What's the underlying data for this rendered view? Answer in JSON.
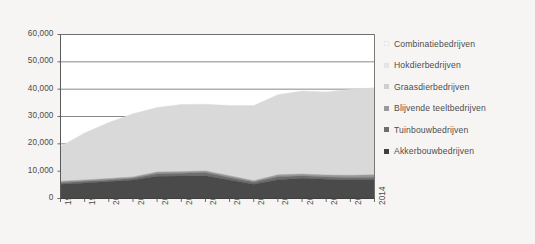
{
  "chart_data": {
    "type": "area",
    "title": "",
    "subtitle": "",
    "xlabel": "",
    "ylabel": "",
    "stacked": true,
    "grid": true,
    "legend_position": "right",
    "ylim": [
      0,
      60000
    ],
    "ytick_labels": [
      "0",
      "10,000",
      "20,000",
      "30,000",
      "40,000",
      "50,000",
      "60,000"
    ],
    "yticks": [
      0,
      10000,
      20000,
      30000,
      40000,
      50000,
      60000
    ],
    "categories": [
      "1998",
      "1999",
      "2000",
      "2001",
      "2002",
      "2003",
      "2004",
      "2007",
      "2009",
      "2010",
      "2011",
      "2012",
      "2013",
      "2014"
    ],
    "x": [
      "1998",
      "1999",
      "2000",
      "2001",
      "2002",
      "2003",
      "2004",
      "2007",
      "2009",
      "2010",
      "2011",
      "2012",
      "2013",
      "2014"
    ],
    "series": [
      {
        "name": "Akkerbouwbedrijven",
        "color": "#4a4a4a",
        "values": [
          5200,
          5700,
          6200,
          6800,
          8100,
          8200,
          8300,
          6800,
          5200,
          6900,
          7400,
          7000,
          6800,
          6900
        ]
      },
      {
        "name": "Tuinbouwbedrijven",
        "color": "#6e6e6e",
        "values": [
          600,
          600,
          600,
          600,
          1000,
          1000,
          1200,
          900,
          800,
          1100,
          900,
          900,
          900,
          900
        ]
      },
      {
        "name": "Blijvende teeltbedrijven",
        "color": "#9a9a9a",
        "values": [
          500,
          500,
          500,
          500,
          600,
          600,
          600,
          600,
          500,
          700,
          700,
          700,
          800,
          900
        ]
      },
      {
        "name": "Graasdierbedrijven",
        "color": "#d9d9d9",
        "values": [
          12700,
          17200,
          20500,
          23100,
          23600,
          24600,
          24400,
          25700,
          27500,
          29300,
          30300,
          30400,
          31500,
          31800
        ]
      },
      {
        "name": "Hokdierbedrijven",
        "color": "#ececec",
        "values": [
          0,
          0,
          0,
          0,
          0,
          0,
          0,
          0,
          0,
          0,
          0,
          0,
          0,
          0
        ]
      },
      {
        "name": "Combinatiebedrijven",
        "color": "#f7f7f7",
        "values": [
          0,
          0,
          0,
          0,
          0,
          0,
          0,
          0,
          0,
          0,
          0,
          0,
          0,
          0
        ]
      }
    ],
    "legend_entries": [
      {
        "label": "Combinatiebedrijven",
        "color": "#f7f7f7"
      },
      {
        "label": "Hokdierbedrijven",
        "color": "#e6e6e6"
      },
      {
        "label": "Graasdierbedrijven",
        "color": "#cfcfcf"
      },
      {
        "label": "Blijvende teeltbedrijven",
        "color": "#9a9a9a"
      },
      {
        "label": "Tuinbouwbedrijven",
        "color": "#6e6e6e"
      },
      {
        "label": "Akkerbouwbedrijven",
        "color": "#3f3f3f"
      }
    ]
  }
}
